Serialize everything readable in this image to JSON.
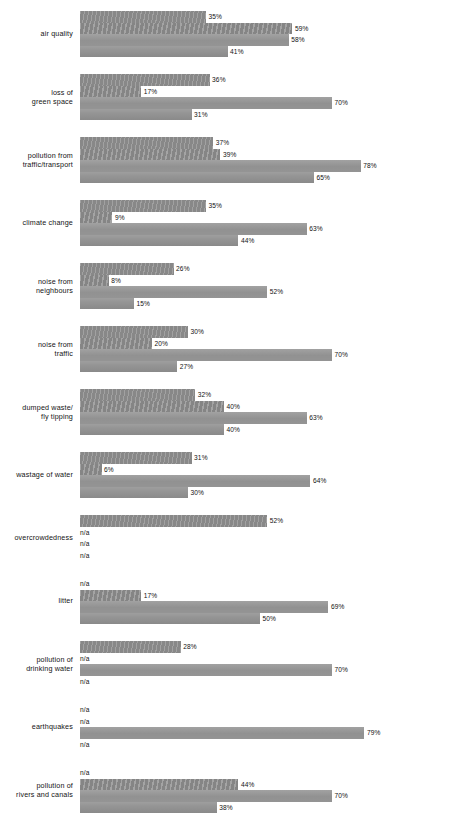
{
  "chart_data": {
    "type": "bar",
    "orientation": "horizontal",
    "title": "",
    "subtitle": "",
    "xlabel": "",
    "ylabel": "",
    "xlim": [
      0,
      100
    ],
    "grid": false,
    "legend": "none",
    "value_suffix": "%",
    "na_label": "n/a",
    "bar_color": "#919191",
    "categories": [
      "air quality",
      "loss of\ngreen space",
      "pollution from\ntraffic/transport",
      "climate change",
      "noise from\nneighbours",
      "noise from\ntraffic",
      "dumped waste/\nfly tipping",
      "wastage of water",
      "overcrowdedness",
      "litter",
      "pollution of\ndrinking water",
      "earthquakes",
      "pollution of\nrivers and canals"
    ],
    "series": [
      {
        "name": "series-1",
        "values": [
          35,
          36,
          37,
          35,
          26,
          30,
          32,
          31,
          52,
          null,
          28,
          null,
          null
        ],
        "labels": [
          "35%",
          "36%",
          "37%",
          "35%",
          "26%",
          "30%",
          "32%",
          "31%",
          "52%",
          "n/a",
          "28%",
          "n/a",
          "n/a"
        ]
      },
      {
        "name": "series-2",
        "values": [
          59,
          17,
          39,
          9,
          8,
          20,
          40,
          6,
          null,
          17,
          null,
          null,
          44
        ],
        "labels": [
          "59%",
          "17%",
          "39%",
          "9%",
          "8%",
          "20%",
          "40%",
          "6%",
          "n/a",
          "17%",
          "n/a",
          "n/a",
          "44%"
        ]
      },
      {
        "name": "series-3",
        "values": [
          58,
          70,
          78,
          63,
          52,
          70,
          63,
          64,
          null,
          69,
          70,
          79,
          70
        ],
        "labels": [
          "58%",
          "70%",
          "78%",
          "63%",
          "52%",
          "70%",
          "63%",
          "64%",
          "n/a",
          "69%",
          "70%",
          "79%",
          "70%"
        ]
      },
      {
        "name": "series-4",
        "values": [
          41,
          31,
          65,
          44,
          15,
          27,
          40,
          30,
          null,
          50,
          null,
          null,
          38
        ],
        "labels": [
          "41%",
          "31%",
          "65%",
          "44%",
          "15%",
          "27%",
          "40%",
          "30%",
          "n/a",
          "50%",
          "n/a",
          "n/a",
          "38%"
        ]
      }
    ]
  }
}
